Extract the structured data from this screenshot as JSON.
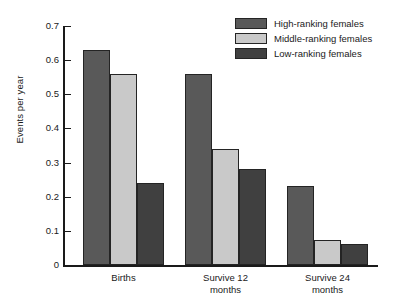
{
  "chart_data": {
    "type": "bar",
    "title": "",
    "xlabel": "",
    "ylabel": "Events per year",
    "ylim": [
      0,
      0.7
    ],
    "ytick_labels": [
      "0.7",
      "0.6",
      "0.5",
      "0.4",
      "0.3",
      "0.2",
      "0.1",
      "0"
    ],
    "ytick_values": [
      0.7,
      0.6,
      0.5,
      0.4,
      0.3,
      0.2,
      0.1,
      0
    ],
    "grid": false,
    "legend_position": "top-right",
    "categories": [
      "Births",
      "Survive 12\nmonths",
      "Survive 24\nmonths"
    ],
    "series": [
      {
        "name": "High-ranking females",
        "color": "#595959",
        "values": [
          0.63,
          0.56,
          0.23
        ]
      },
      {
        "name": "Middle-ranking females",
        "color": "#c9c9c9",
        "values": [
          0.56,
          0.34,
          0.073
        ]
      },
      {
        "name": "Low-ranking females",
        "color": "#404040",
        "values": [
          0.24,
          0.28,
          0.062
        ]
      }
    ]
  }
}
